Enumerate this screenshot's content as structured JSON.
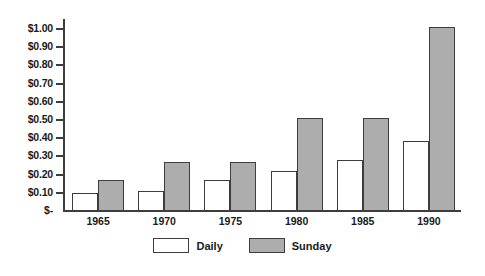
{
  "chart_data": {
    "type": "bar",
    "title": "",
    "subtitle": "",
    "xlabel": "",
    "ylabel": "",
    "categories": [
      "1965",
      "1970",
      "1975",
      "1980",
      "1985",
      "1990"
    ],
    "series": [
      {
        "name": "Daily",
        "color": "#ffffff",
        "values": [
          0.1,
          0.11,
          0.17,
          0.22,
          0.28,
          0.385
        ]
      },
      {
        "name": "Sunday",
        "color": "#adadad",
        "values": [
          0.17,
          0.27,
          0.27,
          0.51,
          0.51,
          1.01
        ]
      }
    ],
    "ylim": [
      0,
      1.05
    ],
    "ytick_values": [
      0,
      0.1,
      0.2,
      0.3,
      0.4,
      0.5,
      0.6,
      0.7,
      0.8,
      0.9,
      1.0
    ],
    "ytick_labels": [
      "$-",
      "$0.10",
      "$0.20",
      "$0.30",
      "$0.40",
      "$0.50",
      "$0.60",
      "$0.70",
      "$0.80",
      "$0.90",
      "$1.00"
    ],
    "grid": false,
    "legend_position": "bottom",
    "annotations": []
  },
  "legend": {
    "entries": [
      {
        "label": "Daily",
        "swatch": "white-square-outline"
      },
      {
        "label": "Sunday",
        "swatch": "gray-square-outline"
      }
    ]
  },
  "colors": {
    "bar_outline": "#3d3d3d",
    "axis": "#3d3d3d",
    "sunday_fill": "#adadad",
    "daily_fill": "#ffffff",
    "text": "#1a1a1a",
    "background": "#ffffff"
  }
}
